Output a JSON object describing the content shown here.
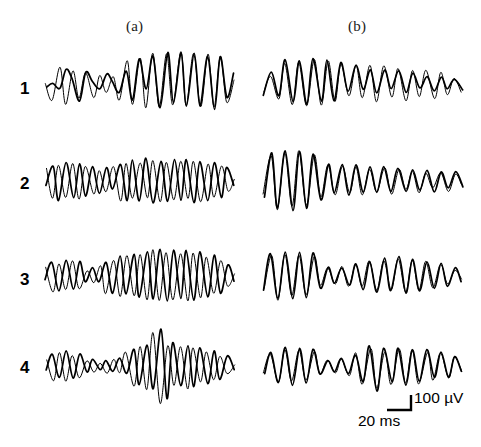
{
  "figure": {
    "type": "multi-panel-waveform-traces",
    "rows": 4,
    "columns": 2,
    "background_color": "#ffffff",
    "trace_color": "#000000",
    "traces_per_panel": 2
  },
  "columns": [
    {
      "id": "a",
      "label": "(a)"
    },
    {
      "id": "b",
      "label": "(b)"
    }
  ],
  "rows": [
    {
      "id": "1",
      "label": "1"
    },
    {
      "id": "2",
      "label": "2"
    },
    {
      "id": "3",
      "label": "3"
    },
    {
      "id": "4",
      "label": "4"
    }
  ],
  "scalebar": {
    "vertical_label": "100 µV",
    "horizontal_label": "20 ms",
    "vertical_value": 100,
    "vertical_unit": "µV",
    "horizontal_value": 20,
    "horizontal_unit": "ms"
  },
  "chart_data": {
    "type": "line",
    "title": "",
    "xlabel": "20 ms",
    "ylabel": "100 µV",
    "grid": false,
    "legend": "none",
    "panel_grid": {
      "rows": [
        "1",
        "2",
        "3",
        "4"
      ],
      "columns": [
        "(a)",
        "(b)"
      ]
    },
    "series_names": [
      "trace-1",
      "trace-2"
    ],
    "panels": [
      {
        "row": "1",
        "column": "a",
        "series": [
          {
            "name": "trace-1",
            "values": [
              0,
              6,
              -4,
              30,
              12,
              -28,
              22,
              8,
              -6,
              20,
              6,
              -10,
              26,
              -22,
              48,
              -4,
              52,
              -38,
              60,
              -30,
              55,
              -34,
              58,
              -36,
              50,
              -40,
              52,
              -18,
              20
            ]
          },
          {
            "name": "trace-2",
            "values": [
              4,
              -24,
              34,
              -30,
              26,
              -22,
              24,
              -18,
              20,
              -10,
              18,
              -24,
              44,
              -30,
              50,
              -36,
              56,
              -34,
              54,
              -32,
              58,
              -34,
              54,
              -36,
              56,
              -38,
              50,
              -26,
              10
            ]
          }
        ]
      },
      {
        "row": "1",
        "column": "b",
        "series": [
          {
            "name": "trace-1",
            "values": [
              -14,
              22,
              -18,
              44,
              -26,
              42,
              -30,
              48,
              -28,
              46,
              -24,
              40,
              -10,
              34,
              -8,
              30,
              -14,
              26,
              -6,
              24,
              -10,
              20,
              -4,
              18,
              -10,
              16,
              -6,
              12,
              -8
            ]
          },
          {
            "name": "trace-2",
            "values": [
              -10,
              18,
              -22,
              38,
              -30,
              40,
              -34,
              44,
              -32,
              42,
              -26,
              36,
              -18,
              38,
              -22,
              34,
              -26,
              36,
              -20,
              30,
              -24,
              28,
              -18,
              26,
              -22,
              22,
              -14,
              14,
              -10
            ]
          }
        ]
      },
      {
        "row": "2",
        "column": "a",
        "series": [
          {
            "name": "trace-1",
            "values": [
              -8,
              26,
              -30,
              34,
              -28,
              30,
              -24,
              28,
              -18,
              24,
              -12,
              32,
              -30,
              36,
              -34,
              40,
              -36,
              38,
              -34,
              40,
              -32,
              38,
              -34,
              36,
              -30,
              34,
              -26,
              24,
              -6
            ]
          },
          {
            "name": "trace-2",
            "values": [
              24,
              -30,
              28,
              -26,
              32,
              -30,
              26,
              -22,
              20,
              -16,
              26,
              -32,
              34,
              -30,
              32,
              -28,
              36,
              -34,
              34,
              -32,
              36,
              -30,
              34,
              -32,
              30,
              -28,
              26,
              -16,
              6
            ]
          }
        ]
      },
      {
        "row": "2",
        "column": "b",
        "series": [
          {
            "name": "trace-1",
            "values": [
              -28,
              50,
              -44,
              56,
              -48,
              52,
              -46,
              50,
              -30,
              32,
              -20,
              30,
              -22,
              28,
              -18,
              26,
              -20,
              28,
              -16,
              24,
              -18,
              22,
              -14,
              20,
              -16,
              18,
              -12,
              16,
              -8
            ]
          },
          {
            "name": "trace-2",
            "values": [
              -20,
              44,
              -50,
              48,
              -44,
              54,
              -42,
              46,
              -26,
              28,
              -24,
              26,
              -18,
              24,
              -22,
              22,
              -16,
              24,
              -20,
              20,
              -14,
              18,
              -18,
              16,
              -12,
              14,
              -16,
              12,
              -6
            ]
          }
        ]
      },
      {
        "row": "3",
        "column": "a",
        "series": [
          {
            "name": "trace-1",
            "values": [
              -6,
              26,
              -24,
              28,
              -22,
              26,
              -10,
              14,
              -8,
              24,
              -26,
              34,
              -30,
              38,
              -34,
              44,
              -38,
              48,
              -40,
              46,
              -36,
              44,
              -38,
              42,
              -34,
              38,
              -28,
              22,
              -6
            ]
          },
          {
            "name": "trace-2",
            "values": [
              18,
              -26,
              24,
              -22,
              28,
              -20,
              12,
              -10,
              18,
              -28,
              30,
              -32,
              36,
              -34,
              40,
              -38,
              46,
              -42,
              44,
              -38,
              42,
              -40,
              40,
              -36,
              36,
              -30,
              26,
              -14,
              4
            ]
          }
        ]
      },
      {
        "row": "3",
        "column": "b",
        "series": [
          {
            "name": "trace-1",
            "values": [
              -24,
              42,
              -38,
              44,
              -36,
              42,
              -34,
              40,
              -20,
              18,
              -10,
              16,
              -12,
              22,
              -20,
              28,
              -24,
              32,
              -26,
              34,
              -28,
              30,
              -24,
              28,
              -20,
              24,
              -14,
              16,
              -6
            ]
          },
          {
            "name": "trace-2",
            "values": [
              -18,
              38,
              -40,
              40,
              -34,
              38,
              -30,
              36,
              -16,
              14,
              -12,
              18,
              -14,
              20,
              -18,
              26,
              -22,
              30,
              -24,
              32,
              -26,
              28,
              -22,
              26,
              -18,
              20,
              -12,
              12,
              -4
            ]
          }
        ]
      },
      {
        "row": "4",
        "column": "a",
        "series": [
          {
            "name": "trace-1",
            "values": [
              -6,
              20,
              -16,
              26,
              -20,
              22,
              -8,
              12,
              -6,
              10,
              -8,
              14,
              -10,
              30,
              -32,
              36,
              -38,
              64,
              -56,
              40,
              -34,
              38,
              -36,
              34,
              -30,
              28,
              -22,
              18,
              -6
            ]
          },
          {
            "name": "trace-2",
            "values": [
              14,
              -22,
              24,
              -26,
              20,
              -18,
              10,
              -8,
              8,
              -10,
              12,
              -12,
              26,
              -34,
              34,
              -40,
              58,
              -62,
              36,
              -32,
              34,
              -38,
              32,
              -28,
              26,
              -24,
              20,
              -12,
              4
            ]
          }
        ]
      },
      {
        "row": "4",
        "column": "b",
        "series": [
          {
            "name": "trace-1",
            "values": [
              -12,
              24,
              -26,
              34,
              -30,
              32,
              -28,
              30,
              -14,
              12,
              -10,
              16,
              -12,
              20,
              -26,
              36,
              -40,
              30,
              -26,
              34,
              -30,
              28,
              -24,
              30,
              -20,
              26,
              -16,
              20,
              -8
            ]
          },
          {
            "name": "trace-2",
            "values": [
              -8,
              20,
              -28,
              30,
              -26,
              30,
              -24,
              28,
              -12,
              10,
              -8,
              14,
              -16,
              24,
              -30,
              32,
              -36,
              26,
              -30,
              30,
              -26,
              32,
              -28,
              26,
              -24,
              22,
              -20,
              16,
              -6
            ]
          }
        ]
      }
    ]
  }
}
